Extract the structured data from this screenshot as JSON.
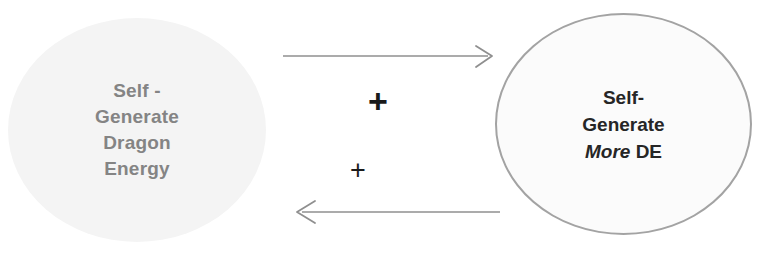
{
  "diagram": {
    "type": "causal-loop-diagram",
    "background_color": "#ffffff",
    "nodes": [
      {
        "id": "self-generate-dragon-energy",
        "shape": "ellipse",
        "fill_color": "#f4f4f4",
        "border_color": "none",
        "text_color": "#848484",
        "lines": [
          "Self -",
          "Generate",
          "Dragon",
          "Energy"
        ]
      },
      {
        "id": "self-generate-more-de",
        "shape": "ellipse",
        "fill_color": "#fbfbfb",
        "border_color": "#a3a3a3",
        "text_color": "#262626",
        "lines": [
          "Self-",
          "Generate"
        ],
        "line_three_italic": "More",
        "line_three_regular": " DE"
      }
    ],
    "links": [
      {
        "id": "link-left-to-right",
        "direction": "right",
        "from": "self-generate-dragon-energy",
        "to": "self-generate-more-de",
        "polarity": "+",
        "color": "#8f8f8f"
      },
      {
        "id": "link-right-to-left",
        "direction": "left",
        "from": "self-generate-more-de",
        "to": "self-generate-dragon-energy",
        "polarity": "+",
        "color": "#8f8f8f"
      }
    ]
  }
}
